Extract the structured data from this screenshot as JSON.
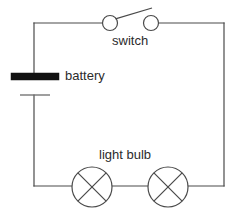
{
  "diagram": {
    "background_color": "#ffffff",
    "wire_color": "#4a4a4a",
    "battery_plate_color": "#111111",
    "label_color": "#2b2b2b",
    "labels": {
      "switch": "switch",
      "battery": "battery",
      "light_bulb": "light bulb"
    },
    "components": [
      {
        "name": "switch",
        "type": "open-switch",
        "label": "switch",
        "state": "open",
        "terminal_left": {
          "cx": 110,
          "cy": 23,
          "r": 7.5
        },
        "terminal_right": {
          "cx": 151,
          "cy": 23,
          "r": 7.5
        },
        "lever": {
          "x1": 116,
          "y1": 19,
          "x2": 152,
          "y2": 8
        }
      },
      {
        "name": "battery",
        "type": "cell",
        "label": "battery",
        "long_plate": {
          "x": 11,
          "y": 73,
          "width": 48,
          "height": 7
        },
        "short_plate": {
          "x1": 20,
          "y1": 95,
          "x2": 50,
          "y2": 95
        }
      },
      {
        "name": "light-bulb-left",
        "type": "lamp",
        "label": "light bulb",
        "circle": {
          "cx": 92,
          "cy": 187,
          "r": 20
        }
      },
      {
        "name": "light-bulb-right",
        "type": "lamp",
        "label": "light bulb",
        "circle": {
          "cx": 168,
          "cy": 187,
          "r": 20
        }
      }
    ],
    "wire_frame": {
      "left_x": 34,
      "right_x": 224,
      "top_y": 23,
      "bottom_y": 186
    }
  }
}
